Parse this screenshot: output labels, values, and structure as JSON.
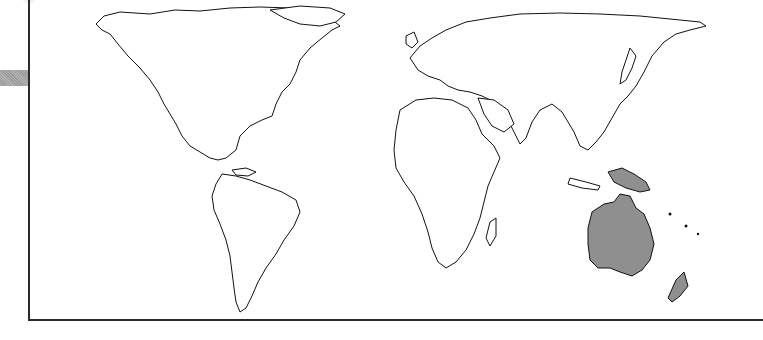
{
  "map": {
    "projection": "equal-area world map",
    "highlighted_region": "Oceania",
    "highlighted_areas": [
      "Australia",
      "New Guinea",
      "New Zealand"
    ],
    "highlight_color": "#8f8f8f",
    "land_fill": "#ffffff",
    "outline_color": "#111111",
    "frame_color": "#2a2a2a"
  }
}
